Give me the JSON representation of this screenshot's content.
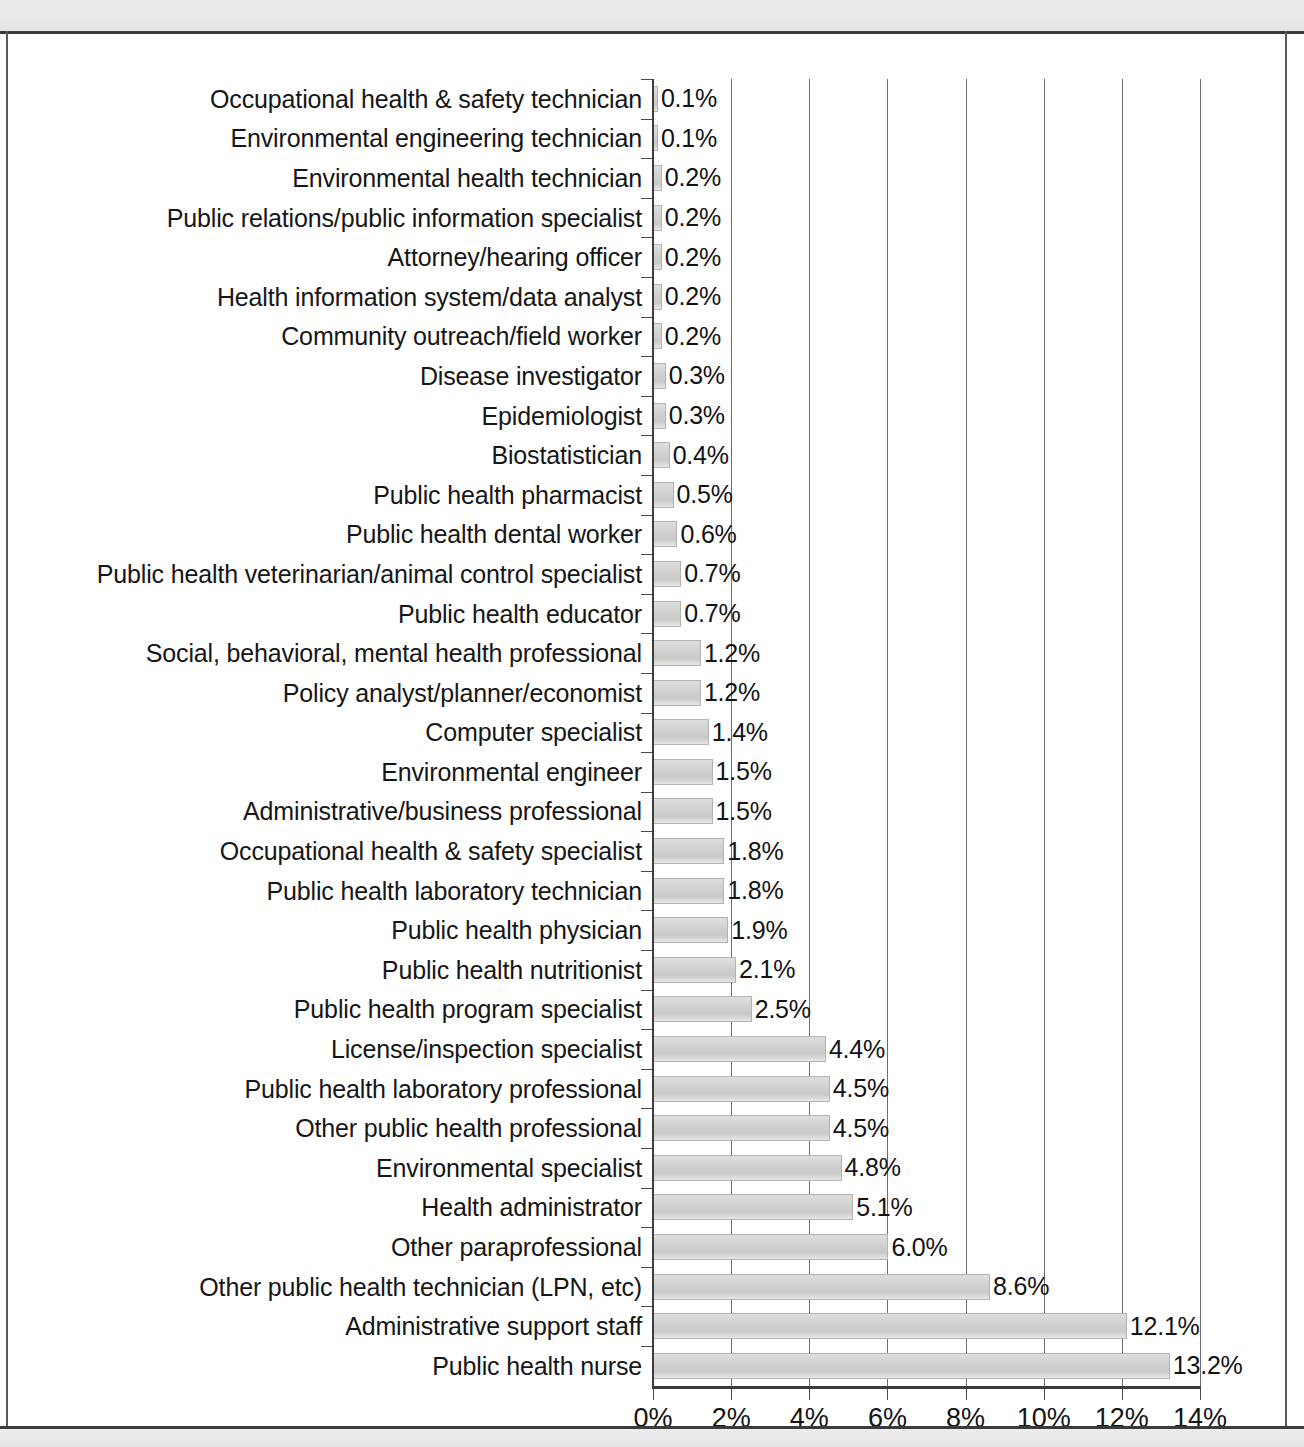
{
  "chart_data": {
    "type": "bar",
    "orientation": "horizontal",
    "title": "",
    "xlabel": "",
    "ylabel": "",
    "xlim": [
      0,
      14
    ],
    "grid": true,
    "legend": false,
    "xticks": [
      "0%",
      "2%",
      "4%",
      "6%",
      "8%",
      "10%",
      "12%",
      "14%"
    ],
    "xtick_values": [
      0,
      2,
      4,
      6,
      8,
      10,
      12,
      14
    ],
    "categories": [
      "Occupational health & safety technician",
      "Environmental engineering technician",
      "Environmental health technician",
      "Public relations/public information specialist",
      "Attorney/hearing officer",
      "Health information system/data analyst",
      "Community outreach/field worker",
      "Disease investigator",
      "Epidemiologist",
      "Biostatistician",
      "Public health pharmacist",
      "Public health dental worker",
      "Public health veterinarian/animal control specialist",
      "Public health educator",
      "Social, behavioral, mental health professional",
      "Policy analyst/planner/economist",
      "Computer specialist",
      "Environmental engineer",
      "Administrative/business professional",
      "Occupational health & safety specialist",
      "Public health laboratory technician",
      "Public health physician",
      "Public health nutritionist",
      "Public health program specialist",
      "License/inspection specialist",
      "Public health laboratory professional",
      "Other public health professional",
      "Environmental specialist",
      "Health administrator",
      "Other paraprofessional",
      "Other public health technician (LPN, etc)",
      "Administrative support staff",
      "Public health nurse"
    ],
    "values": [
      0.1,
      0.1,
      0.2,
      0.2,
      0.2,
      0.2,
      0.2,
      0.3,
      0.3,
      0.4,
      0.5,
      0.6,
      0.7,
      0.7,
      1.2,
      1.2,
      1.4,
      1.5,
      1.5,
      1.8,
      1.8,
      1.9,
      2.1,
      2.5,
      4.4,
      4.5,
      4.5,
      4.8,
      5.1,
      6.0,
      8.6,
      12.1,
      13.2
    ],
    "value_labels": [
      "0.1%",
      "0.1%",
      "0.2%",
      "0.2%",
      "0.2%",
      "0.2%",
      "0.2%",
      "0.3%",
      "0.3%",
      "0.4%",
      "0.5%",
      "0.6%",
      "0.7%",
      "0.7%",
      "1.2%",
      "1.2%",
      "1.4%",
      "1.5%",
      "1.5%",
      "1.8%",
      "1.8%",
      "1.9%",
      "2.1%",
      "2.5%",
      "4.4%",
      "4.5%",
      "4.5%",
      "4.8%",
      "5.1%",
      "6.0%",
      "8.6%",
      "12.1%",
      "13.2%"
    ],
    "bar_color": "#d3d3d2",
    "bar_edge_color": "#b3b3b2",
    "grid_color": "#6d6d70",
    "axis_color": "#3b3b3d",
    "text_color": "#161616"
  }
}
